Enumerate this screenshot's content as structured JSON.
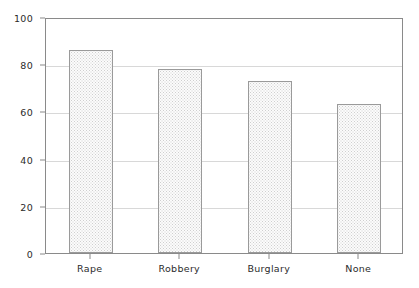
{
  "chart_data": {
    "type": "bar",
    "title": "",
    "subtitle": "",
    "xlabel": "",
    "ylabel": "",
    "categories": [
      "Rape",
      "Robbery",
      "Burglary",
      "None"
    ],
    "values": [
      86,
      78,
      73,
      63
    ],
    "series": [
      {
        "name": "",
        "values": [
          86,
          78,
          73,
          63
        ]
      }
    ],
    "ylim": [
      0,
      100
    ],
    "yticks": [
      0,
      20,
      40,
      60,
      80,
      100
    ],
    "ytick_labels": [
      "0",
      "20",
      "40",
      "60",
      "80",
      "100"
    ],
    "grid": true,
    "grid_axis": "y",
    "legend": false,
    "legend_position": "none",
    "annotations": [],
    "colors": {
      "bar_fill": "#fbfbfb",
      "bar_pattern": "#cfcfcf",
      "bar_border": "#9a9a9a",
      "gridline": "#d8d8d8",
      "axis": "#8a8a8a",
      "text": "#2b2b2b",
      "background": "#ffffff"
    }
  }
}
